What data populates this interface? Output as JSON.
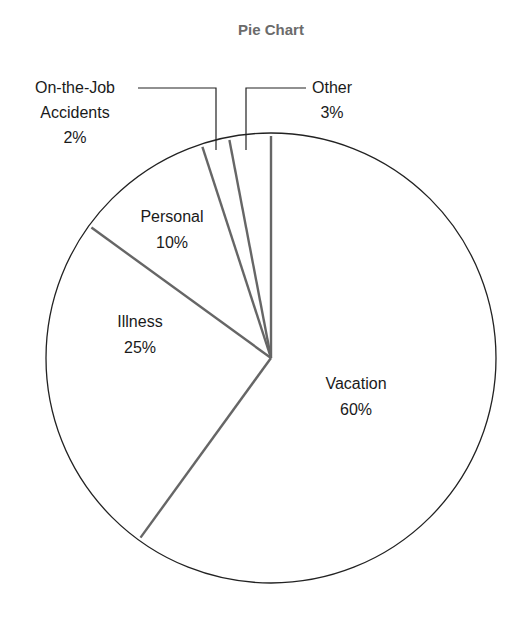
{
  "chart_data": {
    "type": "pie",
    "title": "Pie Chart",
    "categories": [
      "Vacation",
      "Illness",
      "Personal",
      "On-the-Job Accidents",
      "Other"
    ],
    "values": [
      60,
      25,
      10,
      2,
      3
    ],
    "unit": "%",
    "start_angle_deg": 0,
    "direction": "clockwise",
    "labels": [
      {
        "name": "Vacation",
        "lines": [
          "Vacation"
        ],
        "pct": "60%",
        "placement": "inside"
      },
      {
        "name": "Illness",
        "lines": [
          "Illness"
        ],
        "pct": "25%",
        "placement": "inside"
      },
      {
        "name": "Personal",
        "lines": [
          "Personal"
        ],
        "pct": "10%",
        "placement": "inside"
      },
      {
        "name": "On-the-Job Accidents",
        "lines": [
          "On-the-Job",
          "Accidents"
        ],
        "pct": "2%",
        "placement": "outside-leader"
      },
      {
        "name": "Other",
        "lines": [
          "Other"
        ],
        "pct": "3%",
        "placement": "outside-leader"
      }
    ],
    "colors": {
      "outline": "#222222",
      "divider": "#666666",
      "title": "#6b6b6b",
      "fill": "#ffffff"
    }
  }
}
